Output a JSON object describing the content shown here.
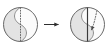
{
  "figure": {
    "caption": "",
    "type": "geometric-transformation-diagram",
    "background_color": "#ffffff",
    "width": 110,
    "height": 49,
    "stroke_color": "#6b6b6b",
    "dark_stroke_color": "#3a3a3a",
    "fill_light": "#f2f2f2",
    "fill_mid": "#dddddd",
    "fill_shadow": "#cfcfcf",
    "arrow_color": "#2e2e2e"
  },
  "panels": [
    {
      "id": "left-panel",
      "label": "before",
      "shape": {
        "name": "circle",
        "cx": 20.5,
        "cy": 24.5,
        "r": 17.0
      },
      "divider": {
        "name": "s-curve-divider",
        "style": "solid",
        "orientation": "vertical-s"
      },
      "axis": {
        "name": "vertical-diameter",
        "style": "dotted",
        "x": 20.5,
        "y_top": 7.5,
        "y_bottom": 41.5,
        "dash": "1,2"
      },
      "regions": [
        {
          "name": "left-lobe",
          "fill": "#e6e6e6"
        },
        {
          "name": "right-lobe",
          "fill": "#fafafa"
        }
      ]
    },
    {
      "id": "right-panel",
      "label": "after",
      "shape": {
        "name": "circle",
        "cx": 87.5,
        "cy": 24.5,
        "r": 17.0
      },
      "divider": {
        "name": "s-curve-divider",
        "style": "solid",
        "orientation": "vertical-s"
      },
      "axis": {
        "name": "vertical-diameter",
        "style": "solid",
        "x": 87.5,
        "y_top": 7.5,
        "y_bottom": 41.5
      },
      "motion": {
        "name": "rotation-arrow",
        "style": "dotted",
        "direction": "down-left",
        "dash": "1,2"
      },
      "regions": [
        {
          "name": "left-lobe",
          "fill": "#e6e6e6"
        },
        {
          "name": "right-lobe",
          "fill": "#fafafa"
        }
      ]
    }
  ],
  "transition": {
    "name": "transform-arrow",
    "symbol": "→",
    "x_start": 44,
    "x_end": 62,
    "y": 24.5,
    "color": "#2e2e2e"
  }
}
